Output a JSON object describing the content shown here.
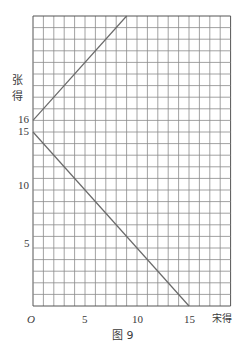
{
  "chart_data": {
    "type": "line",
    "title": "",
    "caption": "图 9",
    "xlabel": "宋得",
    "ylabel": "张得",
    "xlim": [
      0,
      19
    ],
    "ylim": [
      0,
      25
    ],
    "grid": true,
    "grid_step": 1,
    "origin_label": "O",
    "x_ticks": [
      5,
      10,
      15
    ],
    "y_ticks": [
      5,
      10,
      15,
      16
    ],
    "series": [
      {
        "name": "line-rising",
        "x": [
          0,
          9
        ],
        "y": [
          16,
          25
        ],
        "equation": "y = x + 16"
      },
      {
        "name": "line-falling",
        "x": [
          0,
          15
        ],
        "y": [
          15,
          0
        ],
        "equation": "x + y = 15"
      }
    ]
  },
  "labels": {
    "origin": "O",
    "x5": "5",
    "x10": "10",
    "x15": "15",
    "xaxis": "宋得",
    "y5": "5",
    "y10": "10",
    "y15": "15",
    "y16": "16",
    "yaxis_1": "张",
    "yaxis_2": "得",
    "caption": "图 9"
  }
}
